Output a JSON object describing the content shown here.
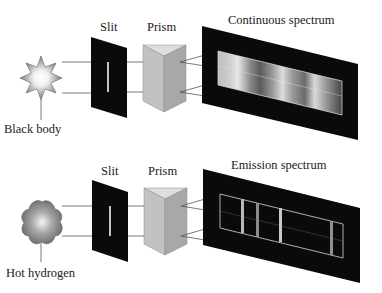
{
  "diagram": {
    "top": {
      "source_label": "Black body",
      "slit_label": "Slit",
      "prism_label": "Prism",
      "screen_label": "Continuous spectrum",
      "source_icon": "star-burst-icon"
    },
    "bottom": {
      "source_label": "Hot hydrogen",
      "slit_label": "Slit",
      "prism_label": "Prism",
      "screen_label": "Emission spectrum",
      "source_icon": "gas-cloud-icon",
      "emission_lines_relative_x": [
        0.18,
        0.3,
        0.49,
        0.91
      ]
    },
    "colors": {
      "panel": "#0a0a0a",
      "prism_front": "#c2c2c2",
      "prism_side": "#a8a8a8",
      "prism_top": "#dedede",
      "ray": "#555555",
      "label": "#1a1a1a"
    }
  }
}
